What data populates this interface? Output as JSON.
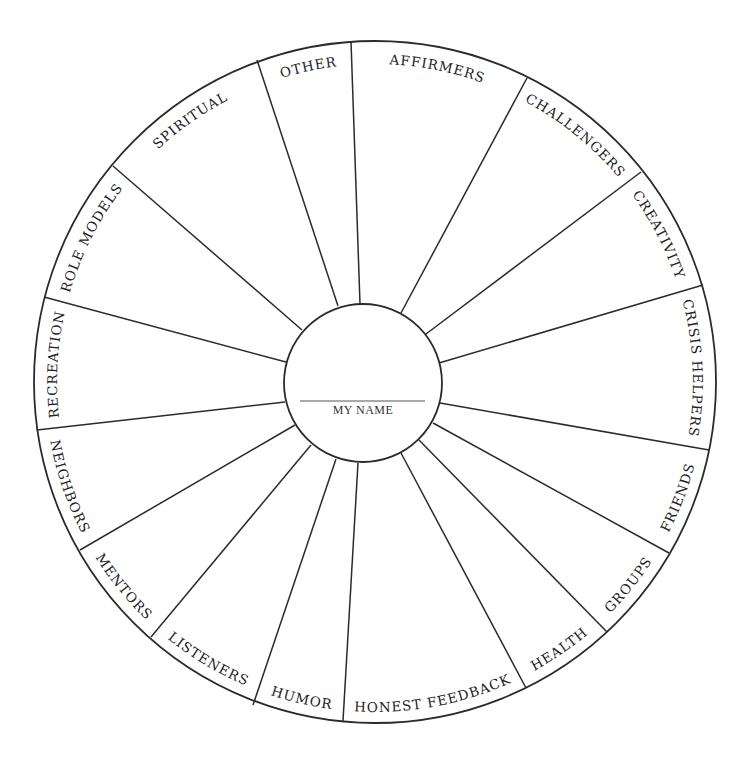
{
  "center": {
    "name_label": "MY NAME"
  },
  "segments": [
    {
      "label": "AFFIRMERS"
    },
    {
      "label": "CHALLENGERS"
    },
    {
      "label": "CREATIVITY"
    },
    {
      "label": "CRISIS HELPERS"
    },
    {
      "label": "FRIENDS"
    },
    {
      "label": "GROUPS"
    },
    {
      "label": "HEALTH"
    },
    {
      "label": "HONEST FEEDBACK"
    },
    {
      "label": "HUMOR"
    },
    {
      "label": "LISTENERS"
    },
    {
      "label": "MENTORS"
    },
    {
      "label": "NEIGHBORS"
    },
    {
      "label": "RECREATION"
    },
    {
      "label": "ROLE MODELS"
    },
    {
      "label": "SPIRITUAL"
    },
    {
      "label": "OTHER"
    }
  ],
  "colors": {
    "stroke": "#2b2b2b",
    "text": "#222222",
    "background": "#ffffff"
  }
}
